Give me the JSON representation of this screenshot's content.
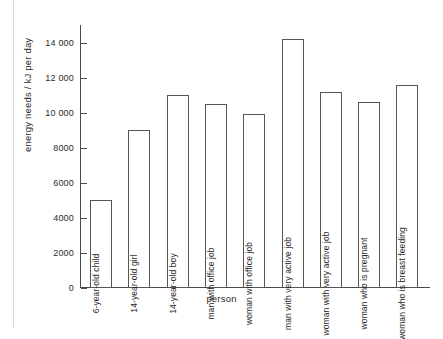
{
  "chart_data": {
    "type": "bar",
    "title": "",
    "xlabel": "person",
    "ylabel": "energy needs / kJ per day",
    "ylim": [
      0,
      15000
    ],
    "ytick_values": [
      0,
      2000,
      4000,
      6000,
      8000,
      10000,
      12000,
      14000
    ],
    "ytick_labels": [
      "0",
      "2000",
      "4000",
      "6000",
      "8000",
      "10 000",
      "12 000",
      "14 000"
    ],
    "grid": false,
    "legend": false,
    "bar_style": {
      "fill": "#ffffff",
      "edge": "#555555",
      "label_position": "inside-vertical"
    },
    "categories": [
      "6-year-old child",
      "14-year-old girl",
      "14-year-old boy",
      "man with office job",
      "woman with office job",
      "man with very active job",
      "woman with very active job",
      "woman who is pregnant",
      "woman who is breast feeding"
    ],
    "values": [
      5000,
      9000,
      11000,
      10500,
      9900,
      14200,
      11200,
      10600,
      11600
    ]
  }
}
